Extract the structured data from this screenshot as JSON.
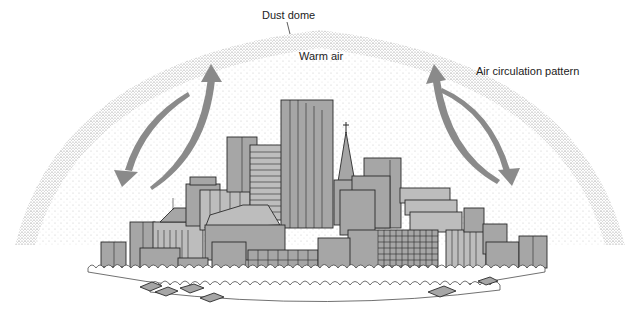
{
  "diagram": {
    "labels": {
      "dust_dome": "Dust dome",
      "warm_air": "Warm air",
      "air_circulation": "Air circulation pattern"
    },
    "elements": [
      "dust-dome",
      "city-skyline",
      "church-spire",
      "trees",
      "houses",
      "circulation-arrows"
    ],
    "colors": {
      "building_fill": "#a6a6a6",
      "arrow_fill": "#8a8a8a",
      "outline": "#2a2a2a",
      "background": "#ffffff"
    }
  }
}
